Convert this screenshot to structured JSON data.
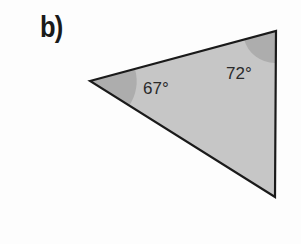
{
  "figure": {
    "part_label": "b)",
    "shape": "triangle",
    "fill_color": "#c4c4c4",
    "angle_shade_color": "#a9a9a9",
    "stroke_color": "#1a1a1a",
    "angles": [
      {
        "vertex": "left",
        "label": "67°"
      },
      {
        "vertex": "top-right",
        "label": "72°"
      }
    ]
  }
}
